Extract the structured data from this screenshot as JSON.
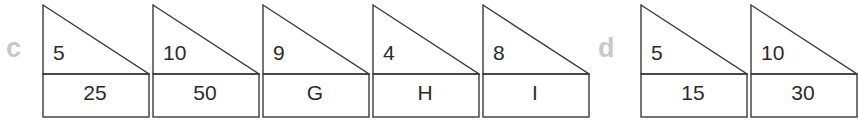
{
  "canvas": {
    "width": 812,
    "height": 125,
    "background": "#ffffff"
  },
  "style": {
    "stroke_color": "#3a3a3a",
    "stroke_width": 1.4,
    "text_color": "#2b2b2b",
    "label_color": "#c9c9c9"
  },
  "groups": [
    {
      "label": "c",
      "label_x": 6,
      "label_y": 35,
      "shapes": [
        {
          "x": 42,
          "top_value": "5",
          "bottom_value": "25",
          "clipped": false
        },
        {
          "x": 152,
          "top_value": "10",
          "bottom_value": "50",
          "clipped": false
        },
        {
          "x": 262,
          "top_value": "9",
          "bottom_value": "G",
          "clipped": false
        },
        {
          "x": 372,
          "top_value": "4",
          "bottom_value": "H",
          "clipped": false
        },
        {
          "x": 482,
          "top_value": "8",
          "bottom_value": "I",
          "clipped": false
        }
      ]
    },
    {
      "label": "d",
      "label_x": 598,
      "label_y": 35,
      "shapes": [
        {
          "x": 640,
          "top_value": "5",
          "bottom_value": "15",
          "clipped": false
        },
        {
          "x": 750,
          "top_value": "10",
          "bottom_value": "30",
          "clipped": true
        }
      ]
    }
  ],
  "geometry": {
    "shape_width": 106,
    "triangle_height": 69,
    "rectangle_height": 43,
    "description": "right triangle with vertical left leg and hypotenuse falling left-to-right, stacked on a rectangle of equal width"
  }
}
